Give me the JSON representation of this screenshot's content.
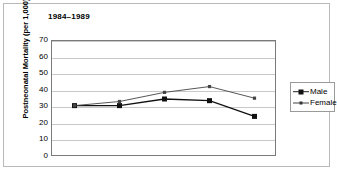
{
  "chart_title": "1984–1989",
  "axes": {
    "y_title": "Postneonatal Mortality (per 1,000)",
    "y_ticks": [
      "70",
      "60",
      "50",
      "40",
      "30",
      "20",
      "10",
      "0"
    ]
  },
  "legend": {
    "items": [
      {
        "label": "Male",
        "marker": "filled-square-marker",
        "line": "thick-line"
      },
      {
        "label": "Female",
        "marker": "small-square-marker",
        "line": "thin-line"
      }
    ]
  },
  "chart_data": {
    "type": "line",
    "title": "1984–1989",
    "xlabel": "",
    "ylabel": "Postneonatal Mortality (per 1,000)",
    "ylim": [
      0,
      70
    ],
    "ytick_step": 10,
    "grid": true,
    "legend_position": "right",
    "x": [
      1,
      2,
      3,
      4,
      5
    ],
    "xtick_labels": [
      "",
      "",
      "",
      "",
      ""
    ],
    "series": [
      {
        "name": "Male",
        "values": [
          31,
          31,
          35,
          34,
          24.5
        ],
        "color": "#111111"
      },
      {
        "name": "Female",
        "values": [
          31,
          33.5,
          39,
          42.5,
          35.5
        ],
        "color": "#444444"
      }
    ]
  }
}
